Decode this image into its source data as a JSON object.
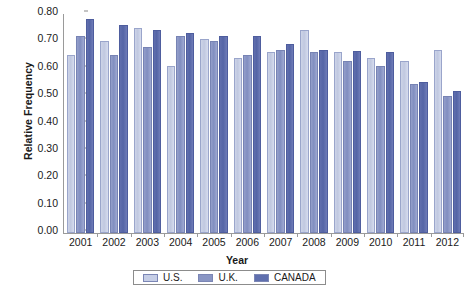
{
  "chart_data": {
    "type": "bar",
    "title": "",
    "xlabel": "Year",
    "ylabel": "Relative Frequency",
    "ylim": [
      0.0,
      0.8
    ],
    "ytick_step": 0.1,
    "ytick_labels": [
      "0.80",
      "0.70",
      "0.60",
      "0.50",
      "0.40",
      "0.30",
      "0.20",
      "0.10",
      "0.00"
    ],
    "ytick_values": [
      0.8,
      0.7,
      0.6,
      0.5,
      0.4,
      0.3,
      0.2,
      0.1,
      0.0
    ],
    "grid": false,
    "legend_position": "bottom",
    "categories": [
      "2001",
      "2002",
      "2003",
      "2004",
      "2005",
      "2006",
      "2007",
      "2008",
      "2009",
      "2010",
      "2011",
      "2012"
    ],
    "series": [
      {
        "name": "U.S.",
        "color": "#c6cee6",
        "values": [
          0.65,
          0.7,
          0.75,
          0.61,
          0.71,
          0.64,
          0.66,
          0.74,
          0.66,
          0.64,
          0.63,
          0.67
        ]
      },
      {
        "name": "U.K.",
        "color": "#8a96c4",
        "values": [
          0.72,
          0.65,
          0.68,
          0.72,
          0.7,
          0.65,
          0.67,
          0.66,
          0.63,
          0.61,
          0.545,
          0.5
        ]
      },
      {
        "name": "CANADA",
        "color": "#5f6fae",
        "values": [
          0.78,
          0.76,
          0.74,
          0.73,
          0.72,
          0.72,
          0.69,
          0.67,
          0.665,
          0.66,
          0.55,
          0.52
        ]
      }
    ]
  }
}
